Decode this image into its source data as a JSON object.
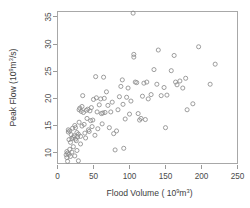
{
  "chart_data": {
    "type": "scatter",
    "title": "",
    "xlabel": "Flood Volume (10^9 m^3)",
    "ylabel": "Peak Flow (10^9 m^3/s)",
    "xlabel_parts": {
      "main": "Flood Volume ( 10",
      "exp1": "9",
      "mid": "m",
      "exp2": "3",
      "tail": ")"
    },
    "ylabel_parts": {
      "main": "Peak Flow (10",
      "exp1": "9",
      "mid": "m",
      "exp2": "3",
      "tail": "/s)"
    },
    "xlim": [
      0,
      250
    ],
    "ylim": [
      8,
      36
    ],
    "xticks": [
      0,
      50,
      100,
      150,
      200,
      250
    ],
    "yticks": [
      10,
      15,
      20,
      25,
      30,
      35
    ],
    "xticklabels": [
      "0",
      "50",
      "100",
      "150",
      "200",
      "250"
    ],
    "yticklabels": [
      "10",
      "15",
      "20",
      "25",
      "30",
      "35"
    ],
    "grid": false,
    "legend": null,
    "marker": "open-circle",
    "marker_color": "#8d8d8d",
    "points": [
      [
        12,
        9.6
      ],
      [
        13,
        10.2
      ],
      [
        13,
        9.1
      ],
      [
        14,
        8.4
      ],
      [
        14,
        9.9
      ],
      [
        15,
        13.8
      ],
      [
        15,
        14.2
      ],
      [
        16,
        12.4
      ],
      [
        16,
        9.7
      ],
      [
        17,
        10.6
      ],
      [
        17,
        14.0
      ],
      [
        18,
        11.9
      ],
      [
        18,
        9.3
      ],
      [
        19,
        13.3
      ],
      [
        20,
        12.6
      ],
      [
        20,
        10.1
      ],
      [
        21,
        14.5
      ],
      [
        22,
        12.8
      ],
      [
        22,
        11.1
      ],
      [
        23,
        13.1
      ],
      [
        24,
        15.0
      ],
      [
        24,
        9.4
      ],
      [
        25,
        12.5
      ],
      [
        25,
        14.6
      ],
      [
        26,
        12.2
      ],
      [
        27,
        13.7
      ],
      [
        27,
        10.4
      ],
      [
        28,
        12.9
      ],
      [
        29,
        8.5
      ],
      [
        29,
        13.4
      ],
      [
        30,
        15.6
      ],
      [
        30,
        17.9
      ],
      [
        31,
        18.2
      ],
      [
        32,
        13.0
      ],
      [
        32,
        11.6
      ],
      [
        33,
        17.6
      ],
      [
        34,
        18.5
      ],
      [
        34,
        14.9
      ],
      [
        35,
        20.5
      ],
      [
        36,
        17.4
      ],
      [
        37,
        15.2
      ],
      [
        38,
        13.6
      ],
      [
        39,
        12.7
      ],
      [
        40,
        17.8
      ],
      [
        41,
        16.3
      ],
      [
        42,
        18.0
      ],
      [
        43,
        14.2
      ],
      [
        44,
        13.9
      ],
      [
        45,
        17.7
      ],
      [
        46,
        15.9
      ],
      [
        47,
        18.3
      ],
      [
        48,
        14.8
      ],
      [
        49,
        16.0
      ],
      [
        50,
        19.8
      ],
      [
        52,
        13.2
      ],
      [
        53,
        24.0
      ],
      [
        54,
        20.1
      ],
      [
        55,
        17.5
      ],
      [
        56,
        14.4
      ],
      [
        58,
        18.8
      ],
      [
        60,
        19.9
      ],
      [
        61,
        17.2
      ],
      [
        62,
        15.3
      ],
      [
        63,
        17.3
      ],
      [
        64,
        23.9
      ],
      [
        65,
        20.0
      ],
      [
        66,
        17.4
      ],
      [
        68,
        21.2
      ],
      [
        70,
        18.7
      ],
      [
        72,
        14.6
      ],
      [
        74,
        17.5
      ],
      [
        76,
        19.3
      ],
      [
        78,
        13.5
      ],
      [
        80,
        10.5
      ],
      [
        82,
        14.0
      ],
      [
        84,
        17.9
      ],
      [
        86,
        20.3
      ],
      [
        88,
        22.2
      ],
      [
        90,
        23.4
      ],
      [
        91,
        18.9
      ],
      [
        92,
        10.8
      ],
      [
        94,
        16.2
      ],
      [
        96,
        20.2
      ],
      [
        98,
        21.9
      ],
      [
        100,
        17.1
      ],
      [
        102,
        19.5
      ],
      [
        105,
        35.7
      ],
      [
        106,
        28.1
      ],
      [
        106,
        27.6
      ],
      [
        108,
        23.0
      ],
      [
        110,
        22.9
      ],
      [
        112,
        17.2
      ],
      [
        114,
        16.0
      ],
      [
        116,
        16.3
      ],
      [
        118,
        20.4
      ],
      [
        120,
        22.8
      ],
      [
        122,
        16.1
      ],
      [
        124,
        23.0
      ],
      [
        126,
        19.9
      ],
      [
        130,
        20.7
      ],
      [
        134,
        25.3
      ],
      [
        138,
        22.6
      ],
      [
        140,
        28.9
      ],
      [
        144,
        20.5
      ],
      [
        148,
        22.0
      ],
      [
        150,
        14.6
      ],
      [
        152,
        20.6
      ],
      [
        158,
        25.1
      ],
      [
        162,
        27.9
      ],
      [
        164,
        23.0
      ],
      [
        166,
        22.5
      ],
      [
        170,
        23.2
      ],
      [
        174,
        21.9
      ],
      [
        178,
        23.7
      ],
      [
        180,
        17.9
      ],
      [
        188,
        19.0
      ],
      [
        196,
        29.5
      ],
      [
        212,
        22.6
      ],
      [
        219,
        26.3
      ]
    ]
  }
}
